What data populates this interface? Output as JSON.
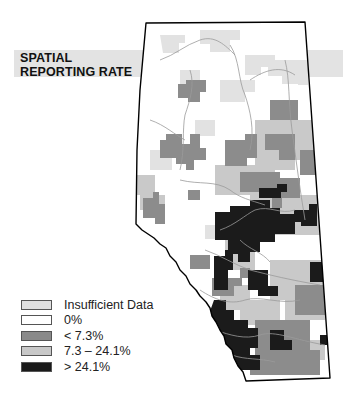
{
  "title": {
    "line1": "SPATIAL",
    "line2": "REPORTING RATE"
  },
  "legend": {
    "items": [
      {
        "label": "Insufficient Data",
        "color": "#e0e0e0"
      },
      {
        "label": "0%",
        "color": "#ffffff"
      },
      {
        "label": "< 7.3%",
        "color": "#8a8a8a"
      },
      {
        "label": "7.3 – 24.1%",
        "color": "#c8c8c8"
      },
      {
        "label": "> 24.1%",
        "color": "#1a1a1a"
      }
    ]
  },
  "map": {
    "region": "Alberta",
    "colors": {
      "insufficient": "#e0e0e0",
      "zero": "#ffffff",
      "low": "#8a8a8a",
      "mid": "#c8c8c8",
      "high": "#1a1a1a",
      "outline": "#000000",
      "rivers": "#9a9a9a"
    }
  }
}
